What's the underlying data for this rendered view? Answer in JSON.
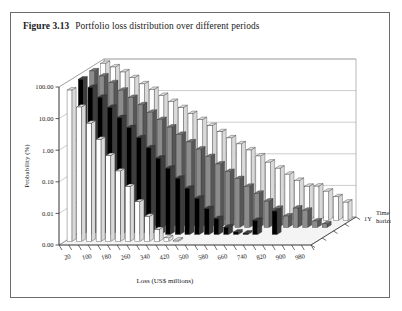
{
  "figure": {
    "number": "Figure 3.13",
    "title": "Portfolio loss distribution over different periods"
  },
  "legend": {
    "position": "top-center",
    "items": [
      {
        "label": "1Y",
        "color": "#ffffff"
      },
      {
        "label": "2Y",
        "color": "#000000"
      },
      {
        "label": "3Y",
        "color": "#8c8c8c"
      },
      {
        "label": "4Y",
        "color": "#ffffff"
      }
    ]
  },
  "chart_data": {
    "type": "bar",
    "projection": "3d-grouped",
    "title": "Portfolio loss distribution over different periods",
    "xlabel": "Loss (US$ millions)",
    "ylabel": "Probability (%)",
    "zlabel": "Time horizon",
    "yscale": "log",
    "ylim": [
      0.001,
      100
    ],
    "ytick_labels": [
      "100.00",
      "10.00",
      "1.00",
      "0.10",
      "0.01",
      "0.00"
    ],
    "ytick_values": [
      100,
      10,
      1,
      0.1,
      0.01,
      0.001
    ],
    "grid": true,
    "categories": [
      20,
      60,
      100,
      140,
      180,
      220,
      260,
      300,
      340,
      380,
      420,
      460,
      500,
      540,
      580,
      620,
      660,
      700,
      740,
      780,
      820,
      860,
      900,
      940,
      980,
      1020
    ],
    "xtick_labels": [
      "20",
      "100",
      "180",
      "260",
      "340",
      "420",
      "500",
      "580",
      "660",
      "740",
      "820",
      "900",
      "980"
    ],
    "xtick_label_step": 2,
    "zcategories": [
      "1Y",
      "2Y",
      "3Y",
      "4Y"
    ],
    "zaxis_visible_label": "1Y",
    "series": [
      {
        "name": "1Y",
        "color": "#ffffff",
        "values": [
          62,
          18,
          5.5,
          1.7,
          0.52,
          0.17,
          0.055,
          0.018,
          0.0062,
          0.0024,
          0.0013,
          0.0011,
          0.001,
          0.001,
          0.001,
          0.001,
          0.001,
          0.001,
          0.001,
          0.001,
          0.001,
          0.001,
          0.001,
          0.001,
          0.001,
          0.001
        ]
      },
      {
        "name": "2Y",
        "color": "#000000",
        "values": [
          82,
          45,
          22,
          10.5,
          5.0,
          2.4,
          1.15,
          0.55,
          0.26,
          0.125,
          0.06,
          0.029,
          0.014,
          0.0066,
          0.0032,
          0.0017,
          0.0012,
          0.0011,
          0.0028,
          0.001,
          0.0055,
          0.001,
          0.001,
          0.001,
          0.001,
          0.001
        ]
      },
      {
        "name": "3Y",
        "color": "#8c8c8c",
        "values": [
          90,
          62,
          38,
          22,
          13,
          7.6,
          4.4,
          2.6,
          1.5,
          0.88,
          0.51,
          0.3,
          0.175,
          0.102,
          0.059,
          0.035,
          0.02,
          0.012,
          0.0068,
          0.004,
          0.0023,
          0.0041,
          0.0035,
          0.0016,
          0.0013,
          0.001
        ]
      },
      {
        "name": "4Y",
        "color": "#ffffff",
        "values": [
          94,
          72,
          50,
          33,
          21,
          14,
          9.0,
          5.8,
          3.7,
          2.4,
          1.55,
          1.0,
          0.64,
          0.41,
          0.265,
          0.17,
          0.11,
          0.07,
          0.045,
          0.029,
          0.0185,
          0.012,
          0.0122,
          0.0084,
          0.0056,
          0.0038
        ]
      }
    ]
  }
}
